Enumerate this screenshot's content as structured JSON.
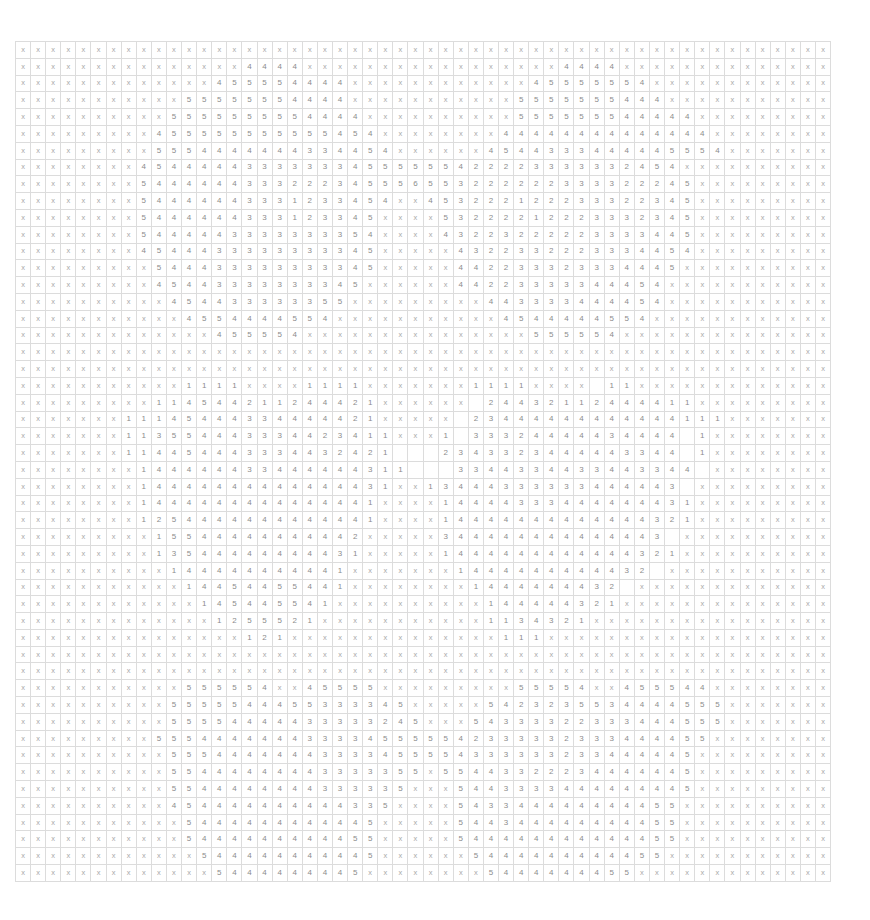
{
  "grid": {
    "columns": 54,
    "row_count": 50,
    "colors": {
      "gridline": "#dcdcdc",
      "text": "#8c8c8c",
      "background": "#ffffff"
    },
    "rows": [
      "x x x x x x x x x x x x x x x x x x x x x x x x x x x x x x x x x x x x x x x x x x x x x x x x x x x x x x",
      "x x x x x x x x x x x x x x x 4 4 4 4 x x x x x x x x x x x x x x x x x 4 4 4 4 x x x x x x x x x x x x x x",
      "x x x x x x x x x x x x x 4 5 5 5 5 4 4 4 4 x x x x x x x x x x x x 4 5 5 5 5 5 5 4 x x x x x x x x x x x x",
      "x x x x x x x x x x x 5 5 5 5 5 5 5 4 4 4 4 x x x x x x x x x x x 5 5 5 5 5 5 5 4 4 4 x x x x x x x x x x x",
      "x x x x x x x x x x 5 5 5 5 5 5 5 5 5 4 4 4 4 x x x x x x x x x x 5 5 5 5 5 5 5 4 4 4 4 4 x x x x x x x x x",
      "x x x x x x x x x 4 5 5 5 5 5 5 5 5 5 5 5 4 5 4 x x x x x x x x 4 4 4 4 4 4 4 4 4 4 4 4 4 4 x x x x x x x x",
      "x x x x x x x x x 5 5 5 4 4 4 4 4 4 4 3 3 4 4 5 4 x x x x x x 4 5 4 4 3 3 3 4 4 4 4 4 5 5 5 4 x x x x x x x",
      "x x x x x x x x 4 5 4 4 4 4 4 3 3 3 3 3 3 3 4 5 5 5 5 5 5 4 2 2 2 2 3 3 3 3 3 3 2 4 5 4 x x x x x x x x x x",
      "x x x x x x x x 5 4 4 4 4 4 4 3 3 3 2 2 2 3 4 5 5 5 6 5 5 3 2 2 2 2 2 2 3 3 3 3 2 2 2 4 5 x x x x x x x x x",
      "x x x x x x x x 5 4 4 4 4 4 4 3 3 3 1 2 3 3 4 5 4 x x 4 5 3 2 2 2 1 2 2 2 3 3 3 2 2 3 4 5 x x x x x x x x x",
      "x x x x x x x x 5 4 4 4 4 4 4 3 3 3 1 2 3 3 4 5 x x x x 5 3 2 2 2 2 1 2 2 2 3 3 3 2 3 4 5 x x x x x x x x x",
      "x x x x x x x x 5 4 4 4 4 4 3 3 3 3 3 3 3 3 5 4 x x x x 4 3 2 2 3 2 2 2 2 2 3 3 3 3 4 4 5 x x x x x x x x x",
      "x x x x x x x x 4 5 4 4 4 3 3 3 3 3 3 3 3 3 4 5 x x x x x 4 3 2 2 3 3 2 2 2 3 3 3 4 4 5 4 x x x x x x x x x",
      "x x x x x x x x x 5 4 4 4 3 3 3 3 3 3 3 3 3 4 5 x x x x x 4 4 2 2 3 3 3 2 3 3 3 4 4 4 5 x x x x x x x x x x",
      "x x x x x x x x x 4 5 4 4 3 3 3 3 3 3 3 3 4 5 x x x x x x 4 4 2 2 3 3 3 3 3 4 4 4 5 4 x x x x x x x x x x x",
      "x x x x x x x x x x 4 5 4 4 3 3 3 3 3 3 5 5 x x x x x x x x x 4 4 3 3 3 3 4 4 4 4 5 4 x x x x x x x x x x x x",
      "x x x x x x x x x x x 4 5 5 4 4 4 4 5 5 4 x x x x x x x x x x x 4 5 4 4 4 4 4 5 5 4 x x x x x x x x x x x x x",
      "x x x x x x x x x x x x x 4 5 5 5 5 4 x x x x x x x x x x x x x x x 5 5 5 5 5 4 x x x x x x x x x x x x x x",
      "x x x x x x x x x x x x x x x x x x x x x x x x x x x x x x x x x x x x x x x x x x x x x x x x x x x x x x",
      "x x x x x x x x x x x x x x x x x x x x x x x x x x x x x x x x x x x x x x x x x x x x x x x x x x x x x x",
      "x x x x x x x x x x x 1 1 1 1 x x x x 1 1 1 1 x x x x x x x 1 1 1 1 x x x x   1 1 x x x x x x x x x x x x x",
      "x x x x x x x x x 1 1 4 5 4 4 2 1 1 2 4 4 4 2 1 x x x x x x   2 4 4 3 2 1 1 2 4 4 4 4 1 1 x x x x x x x x x",
      "x x x x x x x 1 1 1 4 5 4 4 4 3 3 4 4 4 4 4 2 1 x x x x x   2 3 4 4 4 4 4 4 4 4 4 4 4 4 1 1 1 x x x x x x x",
      "x x x x x x x 1 1 3 5 5 4 4 4 3 3 3 4 4 2 3 4 1 1 x x x 1   3 3 3 2 4 4 4 4 4 3 4 4 4 4   1 x x x x x x x x",
      "x x x x x x x 1 1 4 4 5 4 4 4 3 3 3 4 4 3 2 4 2 1       2 3 4 3 3 2 3 4 4 4 4 4 3 3 4 4   1 x x x x x x x x",
      "x x x x x x x x 1 4 4 4 4 4 4 3 3 4 4 4 4 4 4 3 1 1       3 3 4 4 3 3 4 4 3 3 4 4 3 3 4 4   x x x x x x x x x",
      "x x x x x x x x 1 4 4 4 4 4 4 4 4 4 4 4 4 4 4 3 1 x x 1 3 4 4 4 3 3 3 3 3 3 4 4 4 4 4 3   x x x x x x x x x",
      "x x x x x x x x 1 4 4 4 4 4 4 4 4 4 4 4 4 4 4 1 x x x x 1 4 4 4 4 3 3 3 4 4 4 4 4 4 4 3 1 x x x x x x x x x",
      "x x x x x x x x 1 2 5 4 4 4 4 4 4 4 4 4 4 4 4 1 x x x x 1 4 4 4 4 4 4 4 4 4 4 4 4 4 3 2 1 x x x x x x x x x",
      "x x x x x x x x x 1 5 5 4 4 4 4 4 4 4 4 4 4 2 x x x x x 3 4 4 4 4 4 4 4 4 4 4 4 4 4 3   x x x x x x x x x x",
      "x x x x x x x x x 1 3 5 4 4 4 4 4 4 4 4 4 3 1 x x x x x 1 4 4 4 4 4 4 4 4 4 4 4 4 3 2 1 x x x x x x x x x x",
      "x x x x x x x x x x 1 4 4 4 4 4 4 4 4 4 4 1 x x x x x x x 1 4 4 4 4 4 4 4 4 4 4 3 2   x x x x x x x x x x x",
      "x x x x x x x x x x x 1 4 4 5 4 4 5 5 4 4 1 x x x x x x x x 1 4 4 4 4 4 4 4 3 2   x x x x x x x x x x x x x",
      "x x x x x x x x x x x x 1 4 5 4 4 5 5 4 1 x x x x x x x x x x 1 4 4 4 4 4 3 2 1 x x x x x x x x x x x x x x",
      "x x x x x x x x x x x x x 1 2 5 5 5 2 1 x x x x x x x x x x x 1 1 3 4 3 2 1 x x x x x x x x x x x x x x x x",
      "x x x x x x x x x x x x x x x 1 2 1 x x x x x x x x x x x x x x 1 1 1 x x x x x x x x x x x x x x x x x x x",
      "x x x x x x x x x x x x x x x x x x x x x x x x x x x x x x x x x x x x x x x x x x x x x x x x x x x x x x",
      "x x x x x x x x x x x x x x x x x x x x x x x x x x x x x x x x x x x x x x x x x x x x x x x x x x x x x x",
      "x x x x x x x x x x x 5 5 5 5 5 4 x x 4 5 5 5 5 x x x x x x x x x 5 5 5 5 4 x x 4 5 5 5 4 4 x x x x x x x x x",
      "x x x x x x x x x x 5 5 5 5 5 4 4 4 5 5 3 3 3 3 4 5 x x x x x 5 4 2 3 2 3 5 5 3 4 4 4 4 5 5 5 x x x x x x x x",
      "x x x x x x x x x x 5 5 5 5 4 4 4 4 4 3 3 3 3 3 2 4 5 x x x 5 4 3 3 3 3 2 2 3 3 3 4 4 4 5 5 5 x x x x x x x x",
      "x x x x x x x x x 5 5 5 4 4 4 4 4 4 4 3 3 3 3 4 5 5 5 5 5 4 2 3 3 3 3 3 2 3 3 3 4 4 4 4 5 5 x x x x x x x x x",
      "x x x x x x x x x x 5 5 5 4 4 4 4 4 4 4 3 3 3 3 4 5 5 5 5 4 3 3 3 3 3 3 2 3 3 4 4 4 4 4 5 x x x x x x x x x x",
      "x x x x x x x x x x 5 5 4 4 4 4 4 4 4 4 3 3 3 3 3 5 5 x 5 5 4 4 3 3 2 2 2 3 4 4 4 4 4 4 5 x x x x x x x x x x",
      "x x x x x x x x x x 5 5 4 4 4 4 4 4 4 4 3 3 3 3 3 5 x x x 5 4 4 3 3 3 3 4 4 4 4 4 4 4 4 5 x x x x x x x x x x",
      "x x x x x x x x x x 4 5 4 4 4 4 4 4 4 4 4 4 3 3 5 x x x x 5 4 3 3 4 4 4 4 4 4 4 4 4 5 5 x x x x x x x x x x",
      "x x x x x x x x x x x 5 4 4 4 4 4 4 4 4 4 4 4 5 x x x x x 5 4 4 3 4 4 4 4 4 4 4 4 4 5 5 x x x x x x x x x x x",
      "x x x x x x x x x x x 5 4 4 4 4 4 4 4 4 4 4 5 5 x x x x x 5 4 4 4 4 4 4 4 4 4 4 4 4 5 5 x x x x x x x x x x x",
      "x x x x x x x x x x x x 5 4 4 4 4 4 4 4 4 4 4 5 x x x x x x 5 4 4 4 4 4 4 4 4 4 4 5 5 x x x x x x x x x x x x",
      "x x x x x x x x x x x x x 5 4 4 4 4 4 4 4 4 5 x x x x x x x x 5 4 4 4 4 4 4 4 5 5 x x x x x x x x x x x x x x"
    ],
    "rows_tail": [
      "x x x x x x x x x x x x x x 5 4 4 4 4 4 4 5 x x x x x x x x x x 5 4 4 4 4 4 5 5 x x x x x x x x x x x x x x x",
      "x x x x x x x x x x x x x x x 5 4 4 4 4 5 x x x x x x x x x x x x 5 4 4 4 4 5 x x x x x x x x x x x x x x x x",
      "x x x x x x x x x x x x x x x x x 5 5 x x x x x x x x x x x x x x x x 5 5 x x x x x x x x x x x x x x x x x x",
      "x x x x x x x x x x x x x x x x x x x x x x x x x x x x x x x x x x x x x x x x x x x x x x x x x x x x x x"
    ]
  }
}
